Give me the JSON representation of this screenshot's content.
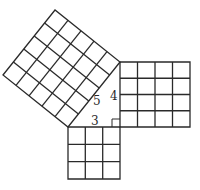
{
  "diagram": {
    "type": "pythagorean-theorem-grid",
    "triangle": {
      "legs": [
        3,
        4
      ],
      "hypotenuse": 5,
      "right_angle_marker": true
    },
    "squares": [
      {
        "name": "square-on-hypotenuse",
        "side": 5,
        "cells": 25
      },
      {
        "name": "square-on-leg-4",
        "side": 4,
        "cells": 16
      },
      {
        "name": "square-on-leg-3",
        "side": 3,
        "cells": 9
      }
    ],
    "labels": {
      "hypotenuse": "5",
      "vertical_leg": "4",
      "horizontal_leg": "3"
    },
    "colors": {
      "line": "#2a2a2a",
      "background": "#ffffff"
    }
  }
}
